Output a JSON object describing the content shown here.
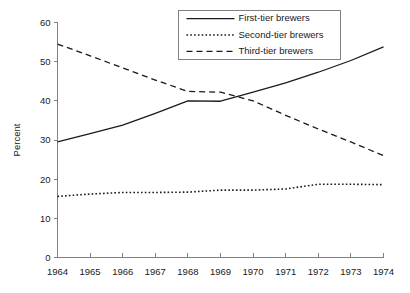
{
  "chart_data": {
    "type": "line",
    "title": "",
    "xlabel": "",
    "ylabel": "Percent",
    "x": [
      1964,
      1965,
      1966,
      1967,
      1968,
      1969,
      1970,
      1971,
      1972,
      1973,
      1974
    ],
    "categories": [
      "1964",
      "1965",
      "1966",
      "1967",
      "1968",
      "1969",
      "1970",
      "1971",
      "1972",
      "1973",
      "1974"
    ],
    "xlim": [
      1964,
      1974
    ],
    "ylim": [
      0,
      60
    ],
    "ytick_values": [
      0,
      10,
      20,
      30,
      40,
      50,
      60
    ],
    "ytick_labels": [
      "0",
      "10",
      "20",
      "30",
      "40",
      "50",
      "60"
    ],
    "grid": false,
    "legend_position": "top-right",
    "series": [
      {
        "name": "First-tier brewers",
        "style": "solid",
        "color": "#1a1a1a",
        "values": [
          29.5,
          31.6,
          33.8,
          36.8,
          40.0,
          39.9,
          42.2,
          44.6,
          47.3,
          50.3,
          53.8
        ]
      },
      {
        "name": "Second-tier brewers",
        "style": "dotted",
        "color": "#1a1a1a",
        "values": [
          15.6,
          16.2,
          16.6,
          16.6,
          16.7,
          17.2,
          17.2,
          17.5,
          18.7,
          18.7,
          18.6
        ]
      },
      {
        "name": "Third-tier brewers",
        "style": "dashed",
        "color": "#1a1a1a",
        "values": [
          54.5,
          51.5,
          48.4,
          45.3,
          42.4,
          42.2,
          40.0,
          36.3,
          32.8,
          29.5,
          26.0
        ]
      }
    ]
  },
  "axes": {
    "y_axis_title": "Percent",
    "y_ticks": [
      "60",
      "50",
      "40",
      "30",
      "20",
      "10",
      "0"
    ],
    "x_ticks": [
      "1964",
      "1965",
      "1966",
      "1967",
      "1968",
      "1969",
      "1970",
      "1971",
      "1972",
      "1973",
      "1974"
    ]
  },
  "legend": {
    "entries": [
      {
        "label": "First-tier brewers",
        "style": "solid"
      },
      {
        "label": "Second-tier brewers",
        "style": "dotted"
      },
      {
        "label": "Third-tier brewers",
        "style": "dashed"
      }
    ]
  },
  "colors": {
    "background": "#ffffff",
    "axis": "#808080",
    "series": "#1a1a1a",
    "text": "#1a1a1a"
  }
}
